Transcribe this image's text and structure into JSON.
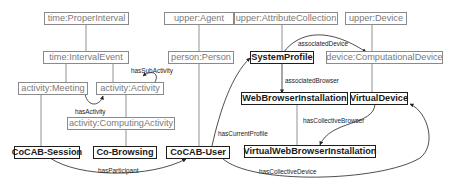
{
  "diagram": {
    "type": "ontology-class-diagram",
    "colors": {
      "upper_ontology_node_border": "#8a8a8a",
      "upper_ontology_node_text": "#7a7a7a",
      "domain_node_border": "#1e1e1e",
      "domain_node_text": "#1a1a1a",
      "edge": "#222222"
    },
    "nodes": {
      "time_proper_interval": "time:ProperInterval",
      "time_interval_event": "time:IntervalEvent",
      "activity_meeting": "activity:Meeting",
      "activity_activity": "activity:Activity",
      "activity_computing_activity": "activity:ComputingActivity",
      "upper_agent": "upper:Agent",
      "person_person": "person:Person",
      "upper_attribute_collection": "upper:AttributeCollection",
      "upper_device": "upper:Device",
      "system_profile": "SystemProfile",
      "device_computational_device": "device:ComputationalDevice",
      "web_browser_installation": "WebBrowserInstallation",
      "virtual_device": "VirtualDevice",
      "virtual_web_browser_installation": "VirtualWebBrowserInstallation",
      "cocab_session": "CoCAB-Session",
      "co_browsing": "Co-Browsing",
      "cocab_user": "CoCAB-User"
    },
    "edges": {
      "has_sub_activity": "hasSubActivity",
      "has_activity": "hasActivity",
      "associated_device": "associatedDevice",
      "associated_browser": "associatedBrowser",
      "has_current_profile": "hasCurrentProfile",
      "has_collective_browser": "hasCollectiveBrowser",
      "has_participant": "hasParticipant",
      "has_collective_device": "hasCollectiveDevice"
    }
  }
}
